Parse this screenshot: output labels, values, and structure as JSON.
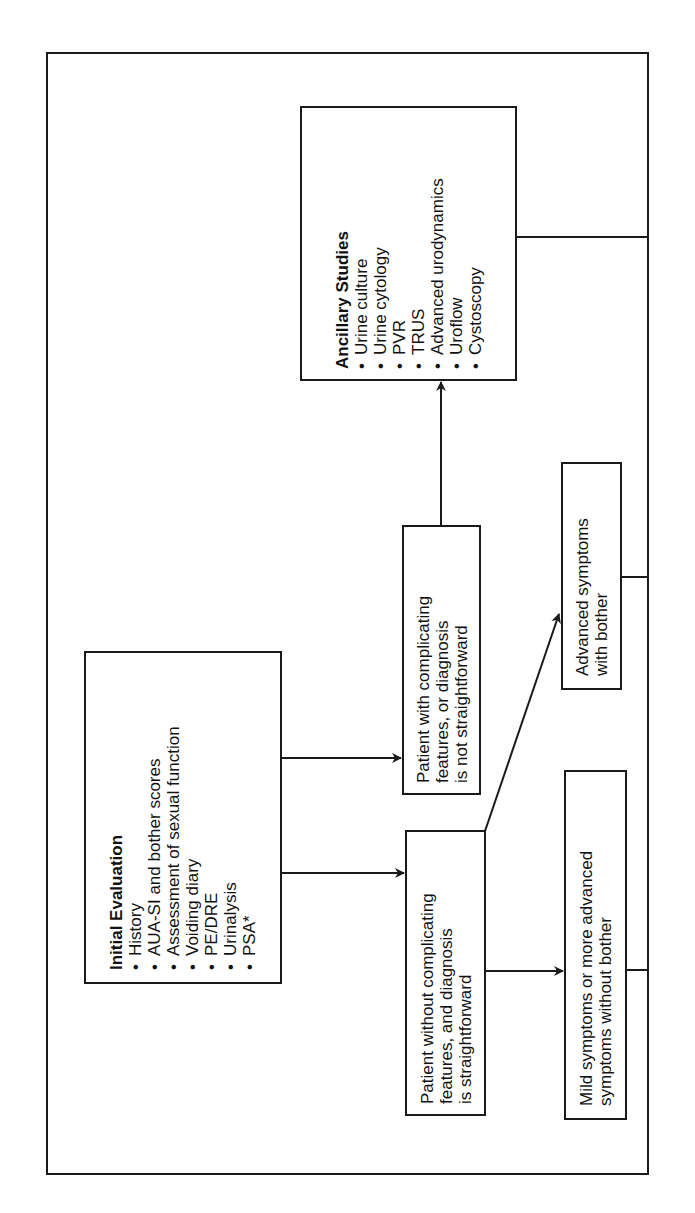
{
  "diagram": {
    "orientation": "rotated-90-ccw",
    "initial_evaluation": {
      "title": "Initial Evaluation",
      "items": [
        "History",
        "AUA-SI and bother scores",
        "Assessment of sexual function",
        "Voiding diary",
        "PE/DRE",
        "Urinalysis",
        "PSA*"
      ]
    },
    "ancillary_studies": {
      "title": "Ancillary Studies",
      "items": [
        "Urine culture",
        "Urine cytology",
        "PVR",
        "TRUS",
        "Advanced urodynamics",
        "Uroflow",
        "Cystoscopy"
      ]
    },
    "complicating": {
      "lines": [
        "Patient with complicating",
        "features, or diagnosis",
        "is not straightforward"
      ]
    },
    "straightforward": {
      "lines": [
        "Patient without complicating",
        "features, and diagnosis",
        "is straightforward"
      ]
    },
    "advanced_symptoms": {
      "lines": [
        "Advanced symptoms",
        "with bother"
      ]
    },
    "mild_symptoms": {
      "lines": [
        "Mild symptoms or more advanced",
        "symptoms without bother"
      ]
    },
    "edges": [
      {
        "from": "initial_evaluation",
        "to": "complicating",
        "arrow": true
      },
      {
        "from": "initial_evaluation",
        "to": "straightforward",
        "arrow": true
      },
      {
        "from": "complicating",
        "to": "ancillary_studies",
        "arrow": true
      },
      {
        "from": "straightforward",
        "to": "advanced_symptoms",
        "arrow": true
      },
      {
        "from": "straightforward",
        "to": "mild_symptoms",
        "arrow": true
      },
      {
        "from": "ancillary_studies",
        "to": "frame-right-edge",
        "arrow": false
      },
      {
        "from": "advanced_symptoms",
        "to": "frame-right-edge",
        "arrow": false
      },
      {
        "from": "mild_symptoms",
        "to": "frame-right-edge",
        "arrow": false
      }
    ],
    "colors": {
      "line": "#1a1a1a",
      "background": "#ffffff",
      "text": "#111111"
    }
  }
}
